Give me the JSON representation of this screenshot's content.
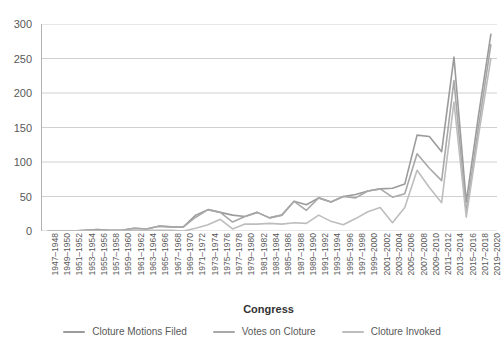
{
  "chart_data": {
    "type": "line",
    "title": "",
    "xlabel": "Congress",
    "ylabel": "",
    "ylim": [
      0,
      300
    ],
    "ytick_step": 50,
    "yticks": [
      0,
      50,
      100,
      150,
      200,
      250,
      300
    ],
    "grid": "horizontal",
    "legend_position": "bottom",
    "categories": [
      "1947–1948",
      "1949–1950",
      "1951–1952",
      "1953–1954",
      "1955–1956",
      "1957–1958",
      "1959–1960",
      "1961–1962",
      "1963–1964",
      "1965–1966",
      "1967–1968",
      "1969–1970",
      "1971–1972",
      "1973–1974",
      "1975–1976",
      "1977–1978",
      "1979–1980",
      "1981–1982",
      "1983–1984",
      "1985–1986",
      "1987–1988",
      "1989–1990",
      "1991–1992",
      "1993–1994",
      "1995–1996",
      "1997–1998",
      "1999–2000",
      "2001–2002",
      "2003–2004",
      "2005–2006",
      "2007–2008",
      "2009–2010",
      "2011–2012",
      "2013–2014",
      "2015–2016",
      "2017–2018",
      "2019–2020"
    ],
    "series": [
      {
        "name": "Cloture Motions Filed",
        "color": "#9b9b9b",
        "values": [
          0,
          0,
          0,
          1,
          2,
          1,
          1,
          4,
          3,
          7,
          6,
          6,
          23,
          31,
          27,
          23,
          21,
          27,
          19,
          23,
          43,
          38,
          48,
          42,
          50,
          53,
          58,
          61,
          62,
          68,
          139,
          137,
          115,
          252,
          42,
          168,
          285
        ]
      },
      {
        "name": "Votes on Cloture",
        "color": "#a8a8a8",
        "values": [
          0,
          0,
          0,
          1,
          2,
          1,
          1,
          4,
          3,
          7,
          6,
          6,
          20,
          31,
          27,
          13,
          21,
          27,
          19,
          23,
          43,
          30,
          48,
          42,
          50,
          48,
          58,
          61,
          49,
          54,
          112,
          91,
          73,
          218,
          27,
          151,
          270
        ]
      },
      {
        "name": "Cloture Invoked",
        "color": "#bdbdbd",
        "values": [
          0,
          0,
          0,
          0,
          0,
          0,
          0,
          1,
          1,
          1,
          1,
          0,
          4,
          9,
          17,
          3,
          10,
          10,
          11,
          10,
          12,
          11,
          23,
          14,
          9,
          18,
          28,
          34,
          12,
          34,
          88,
          63,
          41,
          187,
          20,
          139,
          250
        ]
      }
    ]
  }
}
